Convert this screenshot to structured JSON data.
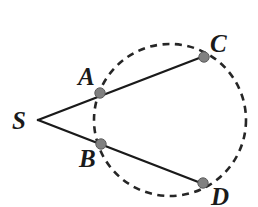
{
  "figure": {
    "background_color": "#ffffff",
    "width": 258,
    "height": 207
  },
  "style": {
    "line_color": "#1a1a1a",
    "line_width": 2.4,
    "circle_color": "#262626",
    "circle_width": 2.6,
    "circle_dash": "7 5.5",
    "point_fill": "#808080",
    "point_stroke": "#5e5e5e",
    "point_radius": 5.2,
    "label_color": "#1a1a1a",
    "label_font_size": 25
  },
  "circle": {
    "name": "dashed-circle",
    "cx": 170,
    "cy": 120,
    "r": 76
  },
  "points": [
    {
      "id": "S",
      "label": "S",
      "cx": 38,
      "cy": 120,
      "show_dot": false,
      "label_x": 12,
      "label_y": 129
    },
    {
      "id": "A",
      "label": "A",
      "cx": 100,
      "cy": 93,
      "show_dot": true,
      "label_x": 78,
      "label_y": 85
    },
    {
      "id": "B",
      "label": "B",
      "cx": 101,
      "cy": 144,
      "show_dot": true,
      "label_x": 79,
      "label_y": 167
    },
    {
      "id": "C",
      "label": "C",
      "cx": 204,
      "cy": 57,
      "show_dot": true,
      "label_x": 210,
      "label_y": 52
    },
    {
      "id": "D",
      "label": "D",
      "cx": 203,
      "cy": 183,
      "show_dot": true,
      "label_x": 211,
      "label_y": 205
    }
  ],
  "segments": [
    {
      "id": "SC",
      "name": "secant-line-s-c",
      "x1": 38,
      "y1": 120,
      "x2": 207,
      "y2": 55
    },
    {
      "id": "SD",
      "name": "secant-line-s-d",
      "x1": 38,
      "y1": 120,
      "x2": 206,
      "y2": 185
    }
  ],
  "chart_data": {
    "type": "diagram",
    "elements": {
      "circle": {
        "center": [
          170,
          120
        ],
        "radius": 76,
        "style": "dashed"
      },
      "external_point": "S",
      "secants": [
        {
          "from": "S",
          "through": "A",
          "to": "C"
        },
        {
          "from": "S",
          "through": "B",
          "to": "D"
        }
      ],
      "labeled_points": [
        "S",
        "A",
        "B",
        "C",
        "D"
      ],
      "points_on_circle": [
        "A",
        "B",
        "C",
        "D"
      ]
    }
  }
}
